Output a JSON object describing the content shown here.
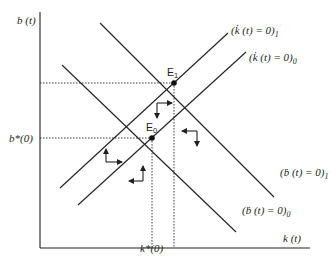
{
  "diagram": {
    "type": "phase-diagram",
    "axes": {
      "y_label": "b (t)",
      "x_label": "k (t)"
    },
    "steady_state_labels": {
      "b_star": "b*(0)",
      "k_star": "k*(0)"
    },
    "equilibria": [
      {
        "id": "E0",
        "label": "E",
        "subscript": "0"
      },
      {
        "id": "E1",
        "label": "E",
        "subscript": "1"
      }
    ],
    "curves": [
      {
        "id": "kdot1",
        "label": "(k̇ (t) = 0)",
        "subscript": "1",
        "slope": "positive"
      },
      {
        "id": "kdot0",
        "label": "(k̇ (t) = 0)",
        "subscript": "0",
        "slope": "positive"
      },
      {
        "id": "bdot1",
        "label": "(ḃ (t) = 0)",
        "subscript": "1",
        "slope": "negative"
      },
      {
        "id": "bdot0",
        "label": "(ḃ (t) = 0)",
        "subscript": "0",
        "slope": "negative"
      }
    ],
    "direction_arrows": [
      {
        "region": "left",
        "directions": [
          "up",
          "right"
        ]
      },
      {
        "region": "bottom",
        "directions": [
          "left",
          "up"
        ]
      },
      {
        "region": "middle",
        "directions": [
          "down",
          "right"
        ]
      },
      {
        "region": "right",
        "directions": [
          "left",
          "down"
        ]
      }
    ]
  }
}
